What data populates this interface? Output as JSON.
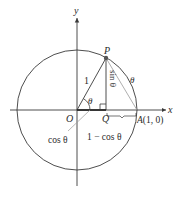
{
  "diagram": {
    "type": "unit-circle",
    "colors": {
      "line": "#3a3a3a",
      "light_line": "#9a9a9a",
      "point": "#555555",
      "background": "#ffffff"
    },
    "labels": {
      "y_axis": "y",
      "x_axis": "x",
      "point_p": "P",
      "origin": "O",
      "point_q": "Q",
      "point_a": "A(1, 0)",
      "radius": "1",
      "angle": "θ",
      "arc": "θ",
      "sin": "sin θ",
      "cos": "cos θ",
      "one_minus_cos": "1 − cos θ"
    }
  }
}
